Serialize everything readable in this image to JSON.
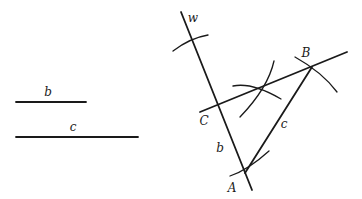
{
  "diagram": {
    "title": "",
    "given_segments": [
      {
        "name": "b",
        "label": "b",
        "x1": 16,
        "y1": 102,
        "x2": 86,
        "y2": 102,
        "label_x": 48,
        "label_y": 96
      },
      {
        "name": "c",
        "label": "c",
        "x1": 16,
        "y1": 137,
        "x2": 138,
        "y2": 137,
        "label_x": 73,
        "label_y": 131
      }
    ],
    "construction": {
      "line_w": {
        "label": "w",
        "x1": 181,
        "y1": 12,
        "x2": 252,
        "y2": 190,
        "label_x": 193,
        "label_y": 22
      },
      "line_CB": {
        "x1": 200,
        "y1": 112,
        "x2": 347,
        "y2": 52
      },
      "segment_AB": {
        "label": "c",
        "x1": 245,
        "y1": 173,
        "x2": 312,
        "y2": 67,
        "label_x": 284,
        "label_y": 128
      },
      "segment_CA_label": {
        "label": "b",
        "x": 220,
        "y": 152
      },
      "points": [
        {
          "name": "A",
          "label": "A",
          "x": 245,
          "y": 173,
          "label_x": 232,
          "label_y": 192
        },
        {
          "name": "B",
          "label": "B",
          "x": 312,
          "y": 67,
          "label_x": 306,
          "label_y": 57
        },
        {
          "name": "C",
          "label": "C",
          "x": 219,
          "y": 105,
          "label_x": 204,
          "label_y": 125
        }
      ],
      "arcs": [
        {
          "name": "arc-top-w",
          "d": "M 173 51 Q 190 38 208 35"
        },
        {
          "name": "arc-intersection-1",
          "d": "M 233 86 Q 252 82 281 99"
        },
        {
          "name": "arc-intersection-2",
          "d": "M 274 61 Q 268 88 240 117"
        },
        {
          "name": "arc-at-B",
          "d": "M 295 57 Q 322 72 337 92"
        },
        {
          "name": "arc-at-A",
          "d": "M 230 176 Q 248 170 269 151"
        }
      ]
    }
  }
}
